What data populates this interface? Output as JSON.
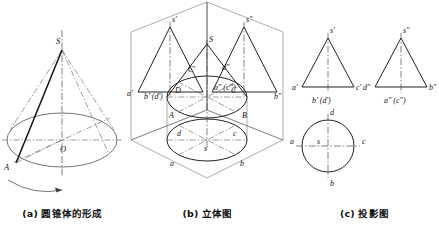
{
  "figure": {
    "background_color": "#ffffff",
    "line_color": "#222222",
    "centerline_color": "#4a4a4a"
  },
  "panels": [
    {
      "key": "a",
      "caption": "(a) 圆锥体的形成",
      "description": "直角三角形绕轴旋转形成圆锥体",
      "labels": {
        "apex": "S",
        "center": "O",
        "base_point": "A"
      },
      "rotation_arrow": "curved-arrow"
    },
    {
      "key": "b",
      "caption": "(b) 立体图",
      "description": "三投影面体系中的圆锥立体图",
      "labels": {
        "front_apex": "s'",
        "side_apex": "s\"",
        "solid_apex": "S",
        "front_left": "a'",
        "front_bottom": "b' (d')",
        "front_c": "C'",
        "side_d": "d\"",
        "side_ac": "a\" (c\")",
        "side_right": "b\"",
        "base_D": "D",
        "base_C": "C",
        "base_A": "A",
        "base_B": "B",
        "top_d": "d",
        "top_c": "c",
        "top_s": "s",
        "top_a": "a",
        "top_b": "b"
      }
    },
    {
      "key": "c",
      "caption": "(c) 投影图",
      "description": "圆锥的三视图：主视图、左视图、俯视图",
      "views": [
        {
          "name": "front-view",
          "shape": "triangle",
          "labels": {
            "apex": "s'",
            "left": "a'",
            "right": "c'",
            "below": "b' (d')"
          }
        },
        {
          "name": "side-view",
          "shape": "triangle",
          "labels": {
            "apex": "s\"",
            "left": "d\"",
            "right": "b\"",
            "below": "a\" (c\")"
          }
        },
        {
          "name": "top-view",
          "shape": "circle",
          "labels": {
            "top": "d",
            "left": "a",
            "center": "s",
            "right": "c",
            "bottom": "b"
          }
        }
      ]
    }
  ]
}
